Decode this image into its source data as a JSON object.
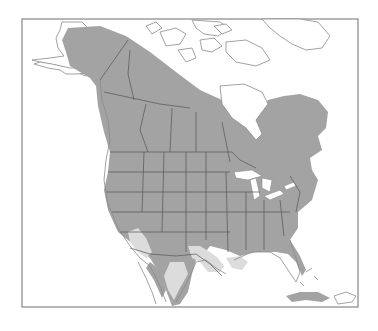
{
  "map": {
    "type": "species range map",
    "region": "North America",
    "colors": {
      "background": "#ffffff",
      "frame": "#6e6e6e",
      "land": "#ffffff",
      "coastline": "#8a8a8a",
      "border": "#555555",
      "range_primary": "#a3a3a3",
      "range_secondary": "#dcdcdc",
      "water": "#ffffff"
    },
    "layers": [
      {
        "id": "range-primary",
        "label": "Primary range",
        "fill": "#a3a3a3"
      },
      {
        "id": "range-secondary",
        "label": "Secondary range",
        "fill": "#dcdcdc"
      }
    ],
    "frame": {
      "x": 22,
      "y": 19,
      "width": 336,
      "height": 288
    }
  }
}
